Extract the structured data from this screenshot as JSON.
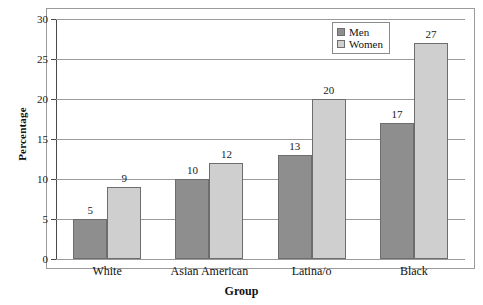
{
  "chart_data": {
    "type": "bar",
    "title": "",
    "xlabel": "Group",
    "ylabel": "Percentage",
    "categories": [
      "White",
      "Asian American",
      "Latina/o",
      "Black"
    ],
    "series": [
      {
        "name": "Men",
        "values": [
          5,
          10,
          13,
          17
        ],
        "color": "#8e8e8e"
      },
      {
        "name": "Women",
        "values": [
          9,
          12,
          20,
          27
        ],
        "color": "#cfcfcf"
      }
    ],
    "ylim": [
      0,
      30
    ],
    "yticks": [
      0,
      5,
      10,
      15,
      20,
      25,
      30
    ],
    "ytick_labels": [
      "0",
      "5",
      "10",
      "15",
      "20",
      "25",
      "30"
    ],
    "grid": "horizontal",
    "legend_position": "top-right-inside",
    "data_labels": true
  },
  "legend": {
    "items": [
      {
        "label": "Men"
      },
      {
        "label": "Women"
      }
    ]
  }
}
